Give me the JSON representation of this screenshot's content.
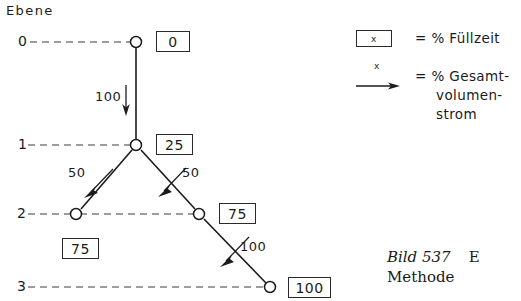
{
  "figure": {
    "axis_title": "Ebene",
    "levels": [
      {
        "label": "0",
        "y": 42
      },
      {
        "label": "1",
        "y": 145
      },
      {
        "label": "2",
        "y": 214
      },
      {
        "label": "3",
        "y": 287
      }
    ],
    "nodes": [
      {
        "id": "n0",
        "level": "0",
        "x": 136,
        "y": 42,
        "fill_time": "0"
      },
      {
        "id": "n1",
        "level": "1",
        "x": 136,
        "y": 145,
        "fill_time": "25"
      },
      {
        "id": "n2l",
        "level": "2",
        "x": 76,
        "y": 214,
        "fill_time": "75"
      },
      {
        "id": "n2r",
        "level": "2",
        "x": 199,
        "y": 214,
        "fill_time": "75"
      },
      {
        "id": "n3",
        "level": "3",
        "x": 270,
        "y": 287,
        "fill_time": "100"
      }
    ],
    "flows": [
      {
        "from": "n0",
        "to": "n1",
        "value": "100",
        "direction": "down"
      },
      {
        "from": "n1",
        "to": "n2l",
        "value": "50",
        "direction": "down-left"
      },
      {
        "from": "n1",
        "to": "n2r",
        "value": "50",
        "direction": "down-right"
      },
      {
        "from": "n2r",
        "to": "n3",
        "value": "100",
        "direction": "down-right"
      }
    ],
    "box_values": {
      "level0": "0",
      "level1": "25",
      "level2_left": "75",
      "level2_right": "75",
      "level3": "100"
    },
    "flow_values": {
      "trunk": "100",
      "branch_left": "50",
      "branch_right": "50",
      "lower": "100"
    }
  },
  "legend": {
    "symbol_text": "x",
    "rows": [
      {
        "symbol": "box",
        "text": "= % Füllzeit"
      },
      {
        "symbol": "arrow",
        "text": "= % Gesamt-",
        "text2": "volumen-",
        "text3": "strom"
      }
    ],
    "fill_time_label": "= % Füllzeit",
    "volume_flow_line1": "= % Gesamt-",
    "volume_flow_line2": "volumen-",
    "volume_flow_line3": "strom"
  },
  "caption": {
    "figure_number": "Bild 537",
    "trailing_word": "E",
    "second_line": "Methode"
  },
  "colors": {
    "ink": "#1b1b1b",
    "line": "#2b2b2b",
    "background": "#ffffff"
  }
}
